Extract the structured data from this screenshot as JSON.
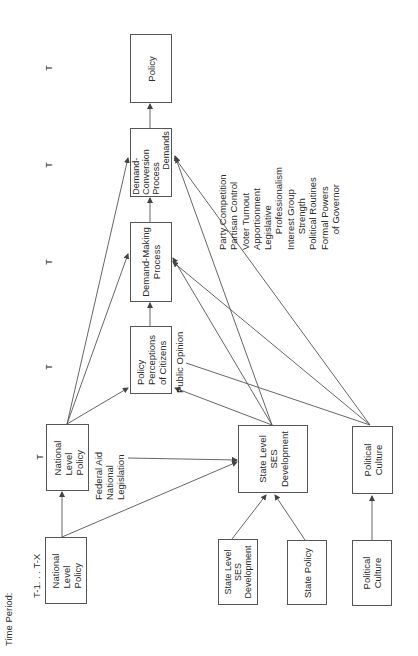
{
  "time_period": {
    "label": "Time Period:",
    "first_column": "T-1. . . T-X",
    "marks": [
      "T",
      "T",
      "T",
      "T",
      "T"
    ]
  },
  "nodes": {
    "national_policy_prev": "National\nLevel\nPolicy",
    "national_policy_t": "National\nLevel\nPolicy",
    "policy_perceptions": "Policy\nPerceptions\nof Citizens",
    "demand_making": "Demand-Making\nProcess",
    "demand_conversion": "Demand-\nConversion\nProcess\n          Demands",
    "policy": "Policy",
    "state_ses_t": "State Level\nSES\nDevelopment",
    "political_culture_t": "Political\nCulture",
    "state_ses_prev": "State Level\nSES\nDevelopment",
    "state_policy": "State Policy",
    "political_culture_prev": "Political\nCulture"
  },
  "annotations": {
    "federal_aid": "Federal Aid\nNational\nLegislation",
    "public_opinion": "Public Opinion",
    "conversion_variables": "Party Competition\nPartisan Control\nVoter Turnout\nApportionment\nLegislative\n      Professionalism\nInterest Group\n      Strength\nPolitical Routines\nFormal Powers\n      of Governor"
  },
  "colors": {
    "line": "#555555",
    "text": "#2a2a2a",
    "background": "#ffffff"
  }
}
